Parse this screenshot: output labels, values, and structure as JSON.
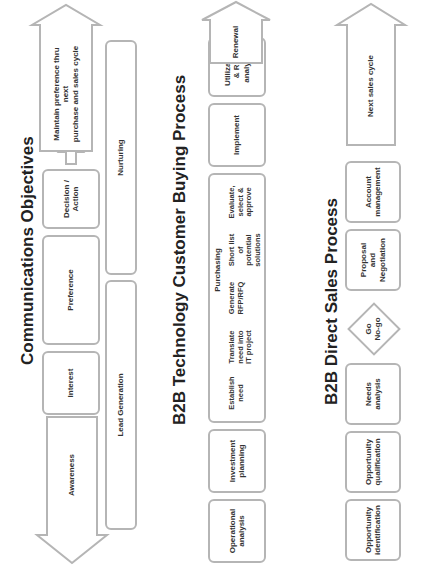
{
  "communications": {
    "title": "Communications Objectives",
    "awareness": "Awareness",
    "interest": "Interest",
    "preference": "Preference",
    "decision": "Decision /\nAction",
    "maintain": "Maintain preference thru next\npurchase and sales cycle",
    "lead_generation": "Lead Generation",
    "nurturing": "Nurturing"
  },
  "buying": {
    "title": "B2B Technology Customer Buying Process",
    "operational": "Operational\nanalysis",
    "investment": "Investment\nplanning",
    "purchasing": {
      "label": "Purchasing",
      "steps": [
        "Establish\nneed",
        "Translate\nneed into\nIT project",
        "Generate\nRFP/RFQ",
        "Short list\nof\npotential\nsolutions",
        "Evaluate,\nselect &\napprove"
      ]
    },
    "implement": "Implement",
    "utilization": "Utilization\n& ROI analysis",
    "renewal": "Renewal"
  },
  "sales": {
    "title": "B2B Direct Sales Process",
    "opp_identification": "Opportunity\nidentification",
    "opp_qualification": "Opportunity\nqualification",
    "needs": "Needs\nanalysis",
    "go_nogo": "Go\nNo-go",
    "proposal": "Proposal\nand\nNegotiation",
    "account": "Account\nmanagement",
    "next_cycle": "Next sales cycle"
  }
}
